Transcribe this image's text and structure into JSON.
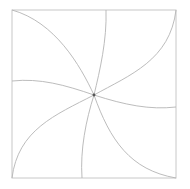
{
  "diagram": {
    "width": 190,
    "height": 189,
    "colors": {
      "background": "#ffffff",
      "frame": "#c8c8c8",
      "spoke": "#b4b4b4",
      "hub": "#555555"
    },
    "frame": {
      "x": 12,
      "y": 10,
      "width": 164,
      "height": 168
    },
    "center": {
      "x": 94,
      "y": 95,
      "r": 1.4
    },
    "spokes": [
      {
        "name": "spoke-top-left-corner",
        "d": "M94 95 C80 65 55 22 12 10"
      },
      {
        "name": "spoke-top-edge",
        "d": "M94 95 C100 70 107 40 106 10"
      },
      {
        "name": "spoke-top-right-corner",
        "d": "M94 95 C130 75 170 60 176 10"
      },
      {
        "name": "spoke-right-edge",
        "d": "M94 95 C125 105 150 110 176 107"
      },
      {
        "name": "spoke-bottom-right-corner",
        "d": "M94 95 C110 140 130 170 176 178"
      },
      {
        "name": "spoke-bottom-edge",
        "d": "M94 95 C86 120 80 150 82 178"
      },
      {
        "name": "spoke-bottom-left-corner",
        "d": "M94 95 C55 115 18 130 12 178"
      },
      {
        "name": "spoke-left-edge",
        "d": "M94 95 C65 85 40 78 12 81"
      }
    ]
  }
}
